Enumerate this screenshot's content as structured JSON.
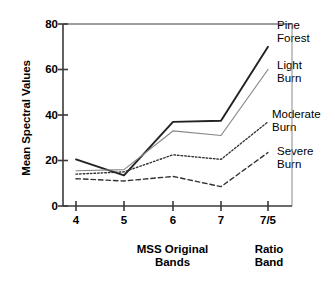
{
  "chart_data": {
    "type": "line",
    "title": "",
    "xlabel_primary": "MSS Original\nBands",
    "xlabel_secondary": "Ratio\nBand",
    "ylabel": "Mean Spectral Values",
    "categories": [
      "4",
      "5",
      "6",
      "7",
      "7/5"
    ],
    "ylim": [
      0,
      80
    ],
    "yticks": [
      "0",
      "20",
      "40",
      "60",
      "80"
    ],
    "grid": false,
    "legend_position": "right-inline",
    "series": [
      {
        "name": "Pine Forest",
        "style": "solid-thick",
        "color": "#222222",
        "values": [
          20.5,
          13.5,
          37.0,
          37.5,
          70.0
        ]
      },
      {
        "name": "Light Burn",
        "style": "solid-thin",
        "color": "#888888",
        "values": [
          15.5,
          16.0,
          33.0,
          31.0,
          60.0
        ]
      },
      {
        "name": "Moderate Burn",
        "style": "dotted",
        "color": "#333333",
        "values": [
          14.0,
          15.0,
          22.5,
          20.5,
          37.0
        ]
      },
      {
        "name": "Severe Burn",
        "style": "dashed",
        "color": "#333333",
        "values": [
          12.0,
          11.0,
          13.0,
          8.5,
          23.5
        ]
      }
    ]
  },
  "axis": {
    "ylabel": "Mean Spectral Values",
    "yticks": [
      "80",
      "60",
      "40",
      "20",
      "0"
    ],
    "xticks": [
      "4",
      "5",
      "6",
      "7",
      "7/5"
    ],
    "xtitle_main_line1": "MSS Original",
    "xtitle_main_line2": "Bands",
    "xtitle_ratio_line1": "Ratio",
    "xtitle_ratio_line2": "Band"
  },
  "legend": [
    {
      "line1": "Pine",
      "line2": "Forest"
    },
    {
      "line1": "Light",
      "line2": "Burn"
    },
    {
      "line1": "Moderate",
      "line2": "Burn"
    },
    {
      "line1": "Severe",
      "line2": "Burn"
    }
  ]
}
